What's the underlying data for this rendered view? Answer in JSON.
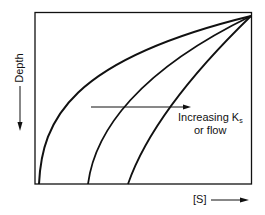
{
  "diagram": {
    "y_axis_label": "Depth",
    "x_axis_label": "[S]",
    "annotation": {
      "line1_prefix": "Increasing K",
      "line1_subscript": "s",
      "line2": "or flow"
    },
    "curves": [
      {
        "name": "curve-1",
        "bottom_x": 39
      },
      {
        "name": "curve-2",
        "bottom_x": 88
      },
      {
        "name": "curve-3",
        "bottom_x": 128
      }
    ],
    "colors": {
      "line": "#111111",
      "background": "#ffffff"
    }
  }
}
